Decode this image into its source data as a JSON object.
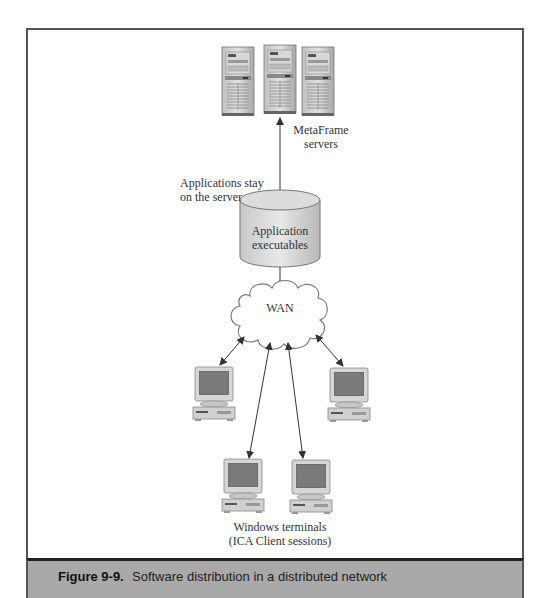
{
  "figure": {
    "number": "Figure 9-9.",
    "caption": "Software distribution in a distributed network"
  },
  "nodes": {
    "servers": {
      "label_line1": "MetaFrame",
      "label_line2": "servers",
      "count": 3
    },
    "database": {
      "label_line1": "Application",
      "label_line2": "executables"
    },
    "annotation": {
      "line1": "Applications stay",
      "line2": "on the server"
    },
    "network": {
      "label": "WAN"
    },
    "terminals": {
      "label_line1": "Windows terminals",
      "label_line2": "(ICA Client sessions)",
      "count": 4
    }
  },
  "edges": [
    {
      "from": "database",
      "to": "servers",
      "type": "arrow"
    },
    {
      "from": "database",
      "to": "network",
      "type": "line"
    },
    {
      "from": "network",
      "to": "terminal-1",
      "type": "bidirectional"
    },
    {
      "from": "network",
      "to": "terminal-2",
      "type": "bidirectional"
    },
    {
      "from": "network",
      "to": "terminal-3",
      "type": "bidirectional"
    },
    {
      "from": "network",
      "to": "terminal-4",
      "type": "bidirectional"
    }
  ],
  "colors": {
    "caption_bg": "#a9a9a9",
    "frame_border": "#555555",
    "line": "#333333"
  }
}
